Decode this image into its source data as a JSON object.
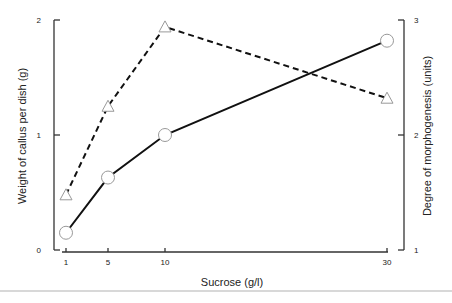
{
  "chart_data": {
    "type": "line",
    "title": "",
    "xlabel": "Sucrose  (g/l)",
    "ylabel": "Weight  of  callus  per  dish  (g)",
    "y2label": "Degree  of  morphogenesis  (units)",
    "x": [
      1,
      5,
      10,
      30
    ],
    "x_tick_labels": [
      "1",
      "5",
      "10",
      "30"
    ],
    "ylim": [
      0,
      2
    ],
    "y_ticks": [
      "0",
      "1",
      "2"
    ],
    "y2lim": [
      1,
      3
    ],
    "y2_ticks": [
      "1",
      "2",
      "3"
    ],
    "grid": false,
    "legend": "none",
    "series": [
      {
        "name": "Weight of callus per dish (g)",
        "axis": "left",
        "marker": "circle",
        "line_style": "solid",
        "values": [
          0.15,
          0.63,
          1.0,
          1.82
        ]
      },
      {
        "name": "Degree of morphogenesis (units)",
        "axis": "right",
        "marker": "triangle",
        "line_style": "dashed",
        "values": [
          1.48,
          2.25,
          2.94,
          2.32
        ]
      }
    ]
  },
  "colors": {
    "line": "#111111",
    "axis": "#333333",
    "marker_fill": "#ffffff",
    "marker_stroke": "#999999"
  }
}
